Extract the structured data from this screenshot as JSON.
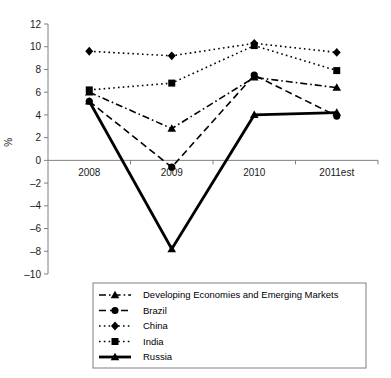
{
  "chart_data": {
    "type": "line",
    "title": "",
    "xlabel": "",
    "ylabel": "%",
    "categories": [
      "2008",
      "2009",
      "2010",
      "2011est"
    ],
    "ylim": [
      -10,
      12
    ],
    "yticks": [
      12,
      10,
      8,
      6,
      4,
      2,
      0,
      -2,
      -4,
      -6,
      -8,
      -10
    ],
    "ytick_labels": [
      "12",
      "10",
      "8",
      "6",
      "4",
      "2",
      "0",
      "-2",
      "-4",
      "-6",
      "-8",
      "-10"
    ],
    "grid": false,
    "legend_position": "bottom",
    "series": [
      {
        "name": "Developing Economies and Emerging Markets",
        "values": [
          6.0,
          2.8,
          7.3,
          6.4
        ],
        "marker": "triangle",
        "line_style": "dashdot",
        "line_width": 1.6
      },
      {
        "name": "Brazil",
        "values": [
          5.2,
          -0.6,
          7.5,
          3.9
        ],
        "marker": "circle",
        "line_style": "dashed",
        "line_width": 1.6
      },
      {
        "name": "China",
        "values": [
          9.6,
          9.2,
          10.3,
          9.5
        ],
        "marker": "diamond",
        "line_style": "dotted",
        "line_width": 1.6
      },
      {
        "name": "India",
        "values": [
          6.2,
          6.8,
          10.1,
          7.9
        ],
        "marker": "square",
        "line_style": "dotted",
        "line_width": 1.6
      },
      {
        "name": "Russia",
        "values": [
          5.2,
          -7.8,
          4.0,
          4.2
        ],
        "marker": "triangle",
        "line_style": "solid",
        "line_width": 2.8
      }
    ]
  },
  "axis": {
    "y_label": "%",
    "zero_line_value": "0"
  },
  "legend": {
    "items": [
      {
        "label": "Developing Economies and Emerging Markets"
      },
      {
        "label": "Brazil"
      },
      {
        "label": "China"
      },
      {
        "label": "India"
      },
      {
        "label": "Russia"
      }
    ]
  },
  "colors": {
    "line": "#000000",
    "axis": "#808080",
    "text": "#1a1a1a",
    "background": "#ffffff"
  }
}
